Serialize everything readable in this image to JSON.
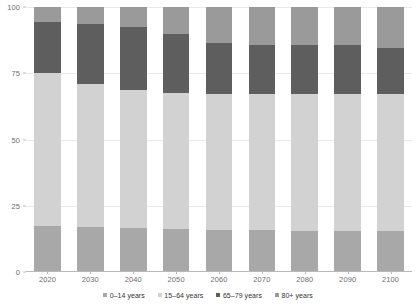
{
  "chart_data": {
    "type": "bar",
    "stacked": true,
    "title": "",
    "subtitle": "",
    "xlabel": "",
    "ylabel": "",
    "categories": [
      "2020",
      "2030",
      "2040",
      "2050",
      "2060",
      "2070",
      "2080",
      "2090",
      "2100"
    ],
    "ylim": [
      0,
      100
    ],
    "yticks": [
      0,
      25,
      50,
      75,
      100
    ],
    "ytick_labels": [
      "0",
      "25",
      "50",
      "75",
      "100"
    ],
    "grid": true,
    "grid_axis": "y",
    "legend_position": "bottom",
    "series": [
      {
        "name": "0–14 years",
        "color": "#a8a8a8",
        "values": [
          17.5,
          17.0,
          16.5,
          16.2,
          16.0,
          15.8,
          15.6,
          15.5,
          15.4
        ]
      },
      {
        "name": "15–64 years",
        "color": "#d2d2d2",
        "values": [
          57.5,
          54.0,
          52.0,
          51.3,
          51.0,
          51.2,
          51.4,
          51.5,
          51.6
        ]
      },
      {
        "name": "65–79 years",
        "color": "#5e5e5e",
        "values": [
          19.5,
          22.5,
          24.0,
          22.5,
          19.5,
          18.5,
          18.5,
          18.5,
          17.5
        ]
      },
      {
        "name": "80+ years",
        "color": "#9a9a9a",
        "values": [
          5.5,
          6.5,
          7.5,
          10.0,
          13.5,
          14.5,
          14.5,
          14.5,
          15.5
        ]
      }
    ]
  },
  "legend": {
    "items": [
      {
        "label": "0–14 years",
        "color": "#a8a8a8"
      },
      {
        "label": "15–64 years",
        "color": "#d2d2d2"
      },
      {
        "label": "65–79 years",
        "color": "#5e5e5e"
      },
      {
        "label": "80+ years",
        "color": "#9a9a9a"
      }
    ]
  },
  "colors": {
    "background": "#ffffff",
    "gridline": "#e9e9e9",
    "axis": "#b9b9b9",
    "tick_text": "#6e6e6e",
    "legend_text": "#333333"
  }
}
